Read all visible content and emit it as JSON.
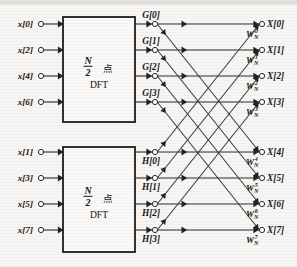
{
  "diagram": {
    "geometry": {
      "width": 297,
      "height": 267,
      "input_node_x": 41,
      "input_arrow_x": 63,
      "mid_node_x": 155,
      "out_node_x": 262,
      "rows_y": [
        24,
        50,
        76,
        102,
        152,
        178,
        204,
        230
      ],
      "box_top": {
        "x": 63,
        "y": 17,
        "w": 72,
        "h": 105
      },
      "box_bottom": {
        "x": 63,
        "y": 147,
        "w": 72,
        "h": 105
      }
    },
    "colors": {
      "background": "#f7f6f4",
      "line": "#2b2b2b",
      "box_stroke": "#1d1d1d",
      "box_fill": "#faf9f7",
      "text": "#161616"
    },
    "inputs": [
      {
        "label": "x[0]",
        "row": 0
      },
      {
        "label": "x[2]",
        "row": 1
      },
      {
        "label": "x[4]",
        "row": 2
      },
      {
        "label": "x[6]",
        "row": 3
      },
      {
        "label": "x[1]",
        "row": 4
      },
      {
        "label": "x[3]",
        "row": 5
      },
      {
        "label": "x[5]",
        "row": 6
      },
      {
        "label": "x[7]",
        "row": 7
      }
    ],
    "blocks": [
      {
        "name": "top-dft-block",
        "numerator": "N",
        "denominator": "2",
        "cn_point": "点",
        "line2": "DFT"
      },
      {
        "name": "bottom-dft-block",
        "numerator": "N",
        "denominator": "2",
        "cn_point": "点",
        "line2": "DFT"
      }
    ],
    "mid_nodes": [
      {
        "label": "G[0]",
        "row": 0,
        "position": "above"
      },
      {
        "label": "G[1]",
        "row": 1,
        "position": "above"
      },
      {
        "label": "G[2]",
        "row": 2,
        "position": "above"
      },
      {
        "label": "G[3]",
        "row": 3,
        "position": "above"
      },
      {
        "label": "H[0]",
        "row": 4,
        "position": "below"
      },
      {
        "label": "H[1]",
        "row": 5,
        "position": "below"
      },
      {
        "label": "H[2]",
        "row": 6,
        "position": "below"
      },
      {
        "label": "H[3]",
        "row": 7,
        "position": "below"
      }
    ],
    "outputs": [
      {
        "label": "X[0]",
        "row": 0,
        "twiddle_base": "W",
        "twiddle_sub": "N",
        "twiddle_sup": "0"
      },
      {
        "label": "X[1]",
        "row": 1,
        "twiddle_base": "W",
        "twiddle_sub": "N",
        "twiddle_sup": "1"
      },
      {
        "label": "X[2]",
        "row": 2,
        "twiddle_base": "W",
        "twiddle_sub": "N",
        "twiddle_sup": "2"
      },
      {
        "label": "X[3]",
        "row": 3,
        "twiddle_base": "W",
        "twiddle_sub": "N",
        "twiddle_sup": "3"
      },
      {
        "label": "X[4]",
        "row": 4,
        "twiddle_base": "W",
        "twiddle_sub": "N",
        "twiddle_sup": "4"
      },
      {
        "label": "X[5]",
        "row": 5,
        "twiddle_base": "W",
        "twiddle_sub": "N",
        "twiddle_sup": "5"
      },
      {
        "label": "X[6]",
        "row": 6,
        "twiddle_base": "W",
        "twiddle_sub": "N",
        "twiddle_sup": "6"
      },
      {
        "label": "X[7]",
        "row": 7,
        "twiddle_base": "W",
        "twiddle_sub": "N",
        "twiddle_sup": "7"
      }
    ],
    "edges": [
      {
        "from_row": 0,
        "to_row": 0,
        "kind": "straight"
      },
      {
        "from_row": 1,
        "to_row": 1,
        "kind": "straight"
      },
      {
        "from_row": 2,
        "to_row": 2,
        "kind": "straight"
      },
      {
        "from_row": 3,
        "to_row": 3,
        "kind": "straight"
      },
      {
        "from_row": 4,
        "to_row": 4,
        "kind": "straight"
      },
      {
        "from_row": 5,
        "to_row": 5,
        "kind": "straight"
      },
      {
        "from_row": 6,
        "to_row": 6,
        "kind": "straight"
      },
      {
        "from_row": 7,
        "to_row": 7,
        "kind": "straight"
      },
      {
        "from_row": 0,
        "to_row": 4,
        "kind": "diagonal-down"
      },
      {
        "from_row": 1,
        "to_row": 5,
        "kind": "diagonal-down"
      },
      {
        "from_row": 2,
        "to_row": 6,
        "kind": "diagonal-down"
      },
      {
        "from_row": 3,
        "to_row": 7,
        "kind": "diagonal-down"
      },
      {
        "from_row": 4,
        "to_row": 0,
        "kind": "diagonal-up"
      },
      {
        "from_row": 5,
        "to_row": 1,
        "kind": "diagonal-up"
      },
      {
        "from_row": 6,
        "to_row": 2,
        "kind": "diagonal-up"
      },
      {
        "from_row": 7,
        "to_row": 3,
        "kind": "diagonal-up"
      }
    ]
  }
}
